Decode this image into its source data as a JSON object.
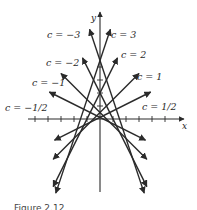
{
  "figure": {
    "caption": "Figure 2.12",
    "axes": {
      "x_label": "x",
      "y_label": "y",
      "origin_px": [
        100,
        119
      ],
      "unit_px": 13,
      "x_ticks": [
        -5,
        -4,
        -3,
        -2,
        -1,
        1,
        2,
        3,
        4,
        5
      ],
      "y_ticks": [
        1,
        2,
        3,
        4
      ]
    },
    "family_equation": "y = cx + c^2/2",
    "lines": [
      {
        "c": 3,
        "label": "c = 3",
        "x_range": [
          -3.4,
          0.8
        ]
      },
      {
        "c": -3,
        "label": "c = −3",
        "x_range": [
          -0.8,
          3.4
        ]
      },
      {
        "c": 2,
        "label": "c = 2",
        "x_range": [
          -3.6,
          1.35
        ]
      },
      {
        "c": -2,
        "label": "c = −2",
        "x_range": [
          -1.35,
          3.6
        ]
      },
      {
        "c": 1,
        "label": "c = 1",
        "x_range": [
          -3.6,
          3.0
        ]
      },
      {
        "c": -1,
        "label": "c = −1",
        "x_range": [
          -3.0,
          3.6
        ]
      },
      {
        "c": 0.5,
        "label": "c = 1/2",
        "x_range": [
          -3.5,
          3.9
        ]
      },
      {
        "c": -0.5,
        "label": "c = −1/2",
        "x_range": [
          -3.9,
          3.5
        ]
      }
    ],
    "labels": [
      {
        "text": "c = −3",
        "x": 47,
        "y": 30
      },
      {
        "text": "c = 3",
        "x": 111,
        "y": 30
      },
      {
        "text": "c = −2",
        "x": 46,
        "y": 58
      },
      {
        "text": "c = 2",
        "x": 121,
        "y": 50
      },
      {
        "text": "c = −1",
        "x": 32,
        "y": 78
      },
      {
        "text": "c = 1",
        "x": 137,
        "y": 72
      },
      {
        "text": "c = −1/2",
        "x": 5,
        "y": 103
      },
      {
        "text": "c = 1/2",
        "x": 142,
        "y": 102
      }
    ],
    "colors": {
      "ink": "#2a2a2a",
      "background": "#ffffff"
    }
  }
}
